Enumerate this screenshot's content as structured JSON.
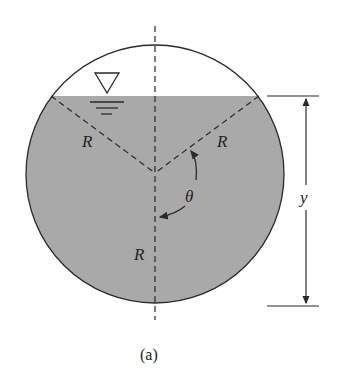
{
  "figure": {
    "caption": "(a)",
    "colors": {
      "liquid_fill": "#a9a9a9",
      "stroke": "#2a2a2a",
      "background": "#ffffff"
    },
    "labels": {
      "radius_left": "R",
      "radius_right": "R",
      "radius_vertical": "R",
      "angle": "θ",
      "depth": "y"
    },
    "symbols": {
      "free_surface": "free-surface-triangle"
    }
  }
}
